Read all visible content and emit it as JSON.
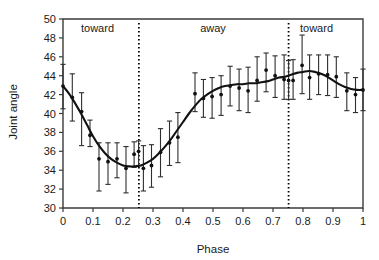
{
  "chart_data": {
    "type": "scatter",
    "title": "",
    "xlabel": "Phase",
    "ylabel": "Joint angle",
    "xlim": [
      0,
      1
    ],
    "ylim": [
      30,
      50
    ],
    "xticks": [
      "0",
      "0.1",
      "0.2",
      "0.3",
      "0.4",
      "0.5",
      "0.6",
      "0.7",
      "0.8",
      "0.9",
      "1"
    ],
    "xtick_values": [
      0,
      0.1,
      0.2,
      0.3,
      0.4,
      0.5,
      0.6,
      0.7,
      0.8,
      0.9,
      1
    ],
    "yticks": [
      "30",
      "32",
      "34",
      "36",
      "38",
      "40",
      "42",
      "44",
      "46",
      "48",
      "50"
    ],
    "ytick_values": [
      30,
      32,
      34,
      36,
      38,
      40,
      42,
      44,
      46,
      48,
      50
    ],
    "grid": false,
    "legend": null,
    "annotations": [
      {
        "text": "toward",
        "x": 0.115,
        "y": 48.6
      },
      {
        "text": "away",
        "x": 0.5,
        "y": 48.6
      },
      {
        "text": "toward",
        "x": 0.845,
        "y": 48.6
      }
    ],
    "vertical_dotted_lines": [
      {
        "x": 0.253,
        "label": "toward/away boundary"
      },
      {
        "x": 0.752,
        "label": "away/toward boundary"
      }
    ],
    "series": [
      {
        "name": "Mean joint angle with SD error bars",
        "x": [
          0.0,
          0.031,
          0.062,
          0.09,
          0.12,
          0.15,
          0.18,
          0.21,
          0.237,
          0.252,
          0.268,
          0.295,
          0.325,
          0.355,
          0.383,
          0.44,
          0.468,
          0.497,
          0.527,
          0.557,
          0.587,
          0.617,
          0.647,
          0.677,
          0.707,
          0.737,
          0.752,
          0.767,
          0.797,
          0.822,
          0.852,
          0.882,
          0.911,
          0.946,
          0.975,
          1.0
        ],
        "y": [
          42.9,
          41.7,
          40.2,
          37.7,
          35.2,
          34.9,
          35.2,
          34.2,
          35.7,
          36.0,
          34.2,
          34.5,
          35.9,
          36.9,
          37.5,
          42.1,
          41.6,
          41.8,
          42.0,
          42.9,
          42.7,
          42.4,
          43.5,
          44.6,
          44.0,
          43.6,
          43.5,
          43.5,
          45.1,
          43.8,
          44.2,
          44.1,
          43.9,
          42.4,
          42.0,
          42.5
        ],
        "yerr_low": [
          2.4,
          2.5,
          3.6,
          1.2,
          3.4,
          2.4,
          2.0,
          2.6,
          1.4,
          1.5,
          2.4,
          2.3,
          2.6,
          2.4,
          2.7,
          1.9,
          2.0,
          2.3,
          2.2,
          2.1,
          2.4,
          2.3,
          2.2,
          2.3,
          2.3,
          2.1,
          2.0,
          2.0,
          3.0,
          2.3,
          2.2,
          2.2,
          2.2,
          2.1,
          1.9,
          2.2
        ],
        "yerr_high": [
          2.3,
          2.5,
          2.0,
          1.6,
          1.7,
          2.0,
          1.7,
          2.3,
          1.3,
          1.1,
          2.4,
          2.2,
          2.5,
          2.3,
          2.6,
          2.2,
          2.0,
          2.0,
          2.0,
          2.1,
          2.0,
          2.5,
          2.5,
          1.8,
          2.1,
          2.6,
          2.1,
          2.2,
          3.2,
          2.4,
          2.0,
          2.1,
          2.1,
          1.9,
          1.8,
          2.2
        ]
      },
      {
        "name": "Smoothed fit curve",
        "x": [
          0.0,
          0.02,
          0.04,
          0.06,
          0.08,
          0.1,
          0.12,
          0.14,
          0.16,
          0.18,
          0.2,
          0.22,
          0.24,
          0.26,
          0.28,
          0.3,
          0.32,
          0.34,
          0.36,
          0.38,
          0.4,
          0.42,
          0.44,
          0.46,
          0.48,
          0.5,
          0.52,
          0.54,
          0.56,
          0.58,
          0.6,
          0.62,
          0.64,
          0.66,
          0.68,
          0.7,
          0.72,
          0.74,
          0.76,
          0.78,
          0.8,
          0.82,
          0.84,
          0.86,
          0.88,
          0.9,
          0.92,
          0.94,
          0.96,
          0.98,
          1.0
        ],
        "y": [
          42.9,
          42.1,
          41.1,
          40.0,
          38.8,
          37.6,
          36.6,
          35.8,
          35.2,
          34.8,
          34.5,
          34.4,
          34.4,
          34.5,
          34.8,
          35.2,
          35.8,
          36.5,
          37.3,
          38.2,
          39.1,
          40.0,
          40.8,
          41.5,
          42.0,
          42.4,
          42.7,
          42.9,
          43.0,
          43.1,
          43.1,
          43.2,
          43.2,
          43.3,
          43.4,
          43.6,
          43.8,
          43.9,
          44.1,
          44.3,
          44.4,
          44.5,
          44.4,
          44.2,
          43.9,
          43.5,
          43.1,
          42.8,
          42.6,
          42.5,
          42.5
        ]
      }
    ]
  },
  "figure": {
    "axis_color": "#3b3b3b",
    "data_color": "#111111",
    "background": "#ffffff"
  }
}
